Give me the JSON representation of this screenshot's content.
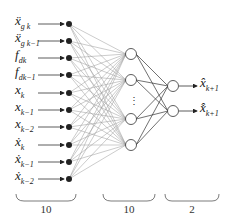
{
  "diagram": {
    "type": "neural-network",
    "inputs": [
      {
        "base": "ẍ",
        "sub": "g k"
      },
      {
        "base": "ẍ",
        "sub": "g k−1"
      },
      {
        "base": "f",
        "sub": "dk"
      },
      {
        "base": "f",
        "sub": "dk−1"
      },
      {
        "base": "x",
        "sub": "k"
      },
      {
        "base": "x",
        "sub": "k−1"
      },
      {
        "base": "x",
        "sub": "k−2"
      },
      {
        "base": "ẋ",
        "sub": "k"
      },
      {
        "base": "ẋ",
        "sub": "k−1"
      },
      {
        "base": "ẋ",
        "sub": "k−2"
      }
    ],
    "outputs": [
      {
        "base": "x̂",
        "sub": "k+1"
      },
      {
        "base": "x̂̇",
        "sub": "k+1"
      }
    ],
    "hidden_ellipsis": "⋮",
    "layer_counts": {
      "input": "10",
      "hidden": "10",
      "output": "2"
    }
  }
}
